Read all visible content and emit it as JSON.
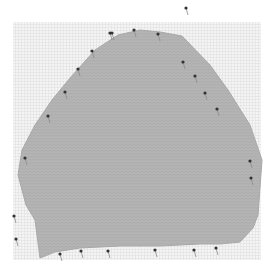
{
  "image": {
    "description": "Photo of a gray knitted swatch pinned out on a gridded blocking board",
    "subject": "knitted swatch",
    "background": "grid blocking board",
    "colors": {
      "page": "#ffffff",
      "board": "#f4f4f4",
      "grid_line": "#d2d2d2",
      "knit": "#b4b4b4",
      "knit_dark": "#a6a6a6",
      "pin_head": "#333333",
      "pin_shaft": "#8a8a8a"
    }
  },
  "board": {
    "x": 13,
    "y": 22,
    "w": 248,
    "h": 238
  },
  "swatch": {
    "points": "40,258 35,220 26,205 18,175 22,150 35,125 52,100 70,78 95,50 118,35 140,30 160,32 182,36 210,65 228,90 250,125 262,160 258,215 253,228 240,242 220,244 200,244 160,246 120,246 80,248 55,252"
  },
  "pins": [
    {
      "x": 110,
      "y": 33
    },
    {
      "x": 134,
      "y": 30
    },
    {
      "x": 158,
      "y": 34
    },
    {
      "x": 186,
      "y": 8
    },
    {
      "x": 112,
      "y": 33
    },
    {
      "x": 92,
      "y": 51
    },
    {
      "x": 78,
      "y": 69
    },
    {
      "x": 65,
      "y": 92
    },
    {
      "x": 48,
      "y": 116
    },
    {
      "x": 183,
      "y": 62
    },
    {
      "x": 195,
      "y": 76
    },
    {
      "x": 205,
      "y": 93
    },
    {
      "x": 217,
      "y": 109
    },
    {
      "x": 250,
      "y": 161
    },
    {
      "x": 251,
      "y": 178
    },
    {
      "x": 25,
      "y": 158
    },
    {
      "x": 14,
      "y": 216
    },
    {
      "x": 16,
      "y": 239
    },
    {
      "x": 60,
      "y": 254
    },
    {
      "x": 81,
      "y": 251
    },
    {
      "x": 108,
      "y": 251
    },
    {
      "x": 155,
      "y": 250
    },
    {
      "x": 216,
      "y": 248
    },
    {
      "x": 194,
      "y": 250
    }
  ]
}
